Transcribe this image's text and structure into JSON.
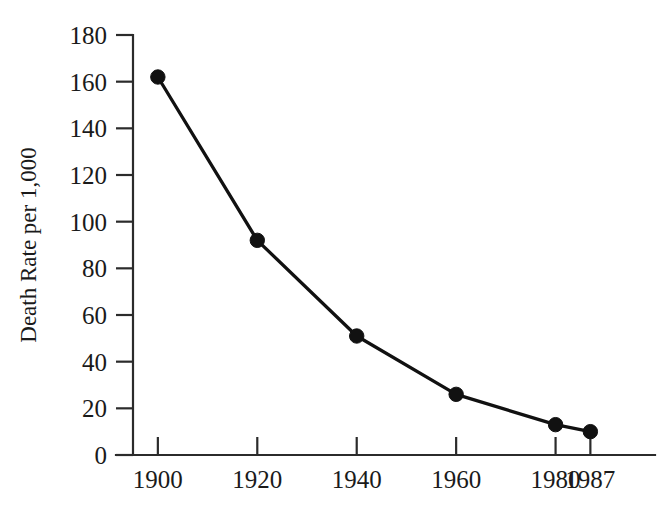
{
  "figure": {
    "cropped_header_remnant": "",
    "background_color": "#ffffff",
    "ink_color": "#111111"
  },
  "chart_data": {
    "type": "line",
    "title": "",
    "xlabel": "",
    "ylabel": "Death Rate per 1,000",
    "x": [
      1900,
      1920,
      1940,
      1960,
      1980,
      1987
    ],
    "categories": [
      "1900",
      "1920",
      "1940",
      "1960",
      "1980",
      "1987"
    ],
    "values": [
      162,
      92,
      51,
      26,
      13,
      10
    ],
    "series": [
      {
        "name": "Death Rate per 1,000",
        "values": [
          162,
          92,
          51,
          26,
          13,
          10
        ]
      }
    ],
    "xlim": [
      1895,
      2000
    ],
    "ylim": [
      0,
      180
    ],
    "xtick_labels": [
      "1900",
      "1920",
      "1940",
      "1960",
      "1980",
      "1987"
    ],
    "ytick_labels": [
      "0",
      "20",
      "40",
      "60",
      "80",
      "100",
      "120",
      "140",
      "160",
      "180"
    ],
    "yticks": [
      0,
      20,
      40,
      60,
      80,
      100,
      120,
      140,
      160,
      180
    ],
    "grid": false,
    "legend": false,
    "legend_position": "none",
    "marker": "filled-circle",
    "line_color": "#111111",
    "marker_color": "#111111",
    "axis_color": "#2b2b2b"
  }
}
